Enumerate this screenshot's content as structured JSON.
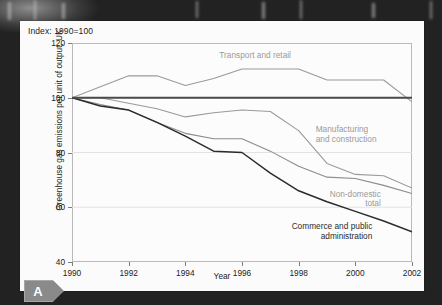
{
  "badge": {
    "letter": "A",
    "icon": "arrow-tab-badge"
  },
  "chart": {
    "index_note": "Index: 1990=100",
    "ylabel": "Greenhouse gas emissions per unit of output, UK",
    "xlabel": "Year"
  },
  "chart_data": {
    "type": "line",
    "title": "Index: 1990=100",
    "xlabel": "Year",
    "ylabel": "Greenhouse gas emissions per unit of output, UK",
    "xlim": [
      1990,
      2002
    ],
    "ylim": [
      40,
      120
    ],
    "yticks": [
      40,
      60,
      80,
      100,
      120
    ],
    "xticks": [
      1990,
      1992,
      1994,
      1996,
      1998,
      2000,
      2002
    ],
    "grid": "horizontal",
    "legend_position": "inline-annotations",
    "x": [
      1990,
      1991,
      1992,
      1993,
      1994,
      1995,
      1996,
      1997,
      1998,
      1999,
      2000,
      2001,
      2002
    ],
    "series": [
      {
        "name": "Transport and retail",
        "color": "#9a9a9a",
        "values": [
          100,
          104,
          108,
          108,
          104.5,
          107,
          110.5,
          110.5,
          110.5,
          106.5,
          106.5,
          106.5,
          98.5
        ]
      },
      {
        "name": "Manufacturing and construction",
        "color": "#9a9a9a",
        "values": [
          100,
          100,
          98,
          96,
          93,
          94.5,
          95.5,
          95,
          88,
          76,
          72,
          71.5,
          67
        ]
      },
      {
        "name": "Non-domestic total",
        "color": "#8b8b8b",
        "values": [
          100,
          97.5,
          95.5,
          91,
          87,
          85,
          85,
          80.5,
          75,
          71,
          70.5,
          68,
          65
        ]
      },
      {
        "name": "Commerce and public administration",
        "color": "#2b2b2b",
        "values": [
          100,
          97,
          95.5,
          91,
          86,
          80.5,
          80,
          72.5,
          66,
          62,
          58.5,
          55,
          51
        ]
      },
      {
        "name": "Reference line (index = 100)",
        "color": "#4a4a4a",
        "values": [
          100,
          100,
          100,
          100,
          100,
          100,
          100,
          100,
          100,
          100,
          100,
          100,
          100
        ]
      }
    ],
    "annotations": [
      {
        "text": "Transport and retail",
        "x": 1995.2,
        "y": 115.5,
        "color": "#9a9a9a",
        "align": "left"
      },
      {
        "text": "Manufacturing",
        "x": 1998.6,
        "y": 88.5,
        "color": "#9a9a9a",
        "align": "left"
      },
      {
        "text": "and construction",
        "x": 1998.6,
        "y": 85.0,
        "color": "#9a9a9a",
        "align": "left"
      },
      {
        "text": "Non-domestic",
        "x": 2000.9,
        "y": 65.0,
        "color": "#9a9a9a",
        "align": "right"
      },
      {
        "text": "total",
        "x": 2000.9,
        "y": 61.5,
        "color": "#9a9a9a",
        "align": "right"
      },
      {
        "text": "Commerce and public",
        "x": 2000.6,
        "y": 53.0,
        "color": "#2b2b2b",
        "align": "right"
      },
      {
        "text": "administration",
        "x": 2000.6,
        "y": 49.5,
        "color": "#2b2b2b",
        "align": "right"
      }
    ]
  }
}
